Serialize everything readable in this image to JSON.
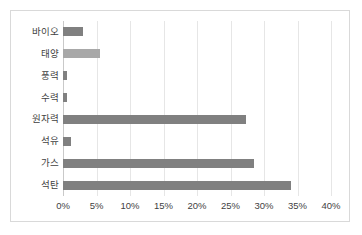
{
  "chart_data": {
    "type": "bar",
    "orientation": "horizontal",
    "title": "",
    "subtitle": "",
    "xlabel": "",
    "ylabel": "",
    "xlim": [
      0,
      40
    ],
    "xtick_labels": [
      "0%",
      "5%",
      "10%",
      "15%",
      "20%",
      "25%",
      "30%",
      "35%",
      "40%"
    ],
    "xtick_values": [
      0,
      5,
      10,
      15,
      20,
      25,
      30,
      35,
      40
    ],
    "grid": true,
    "legend": false,
    "categories": [
      "바이오",
      "태양",
      "풍력",
      "수력",
      "원자력",
      "석유",
      "가스",
      "석탄"
    ],
    "values": [
      3.0,
      5.5,
      0.6,
      0.6,
      27.3,
      1.2,
      28.5,
      34.0
    ],
    "bar_colors": [
      "#808080",
      "#a8a8a8",
      "#808080",
      "#808080",
      "#808080",
      "#808080",
      "#808080",
      "#808080"
    ]
  },
  "style": {
    "bar_color": "#808080",
    "bar_color_light": "#a8a8a8",
    "grid_color": "#e6e6e6",
    "axis_color": "#c9c9c9",
    "border_color": "#d9d9d9",
    "text_color": "#3f3f3f",
    "background": "#ffffff"
  }
}
